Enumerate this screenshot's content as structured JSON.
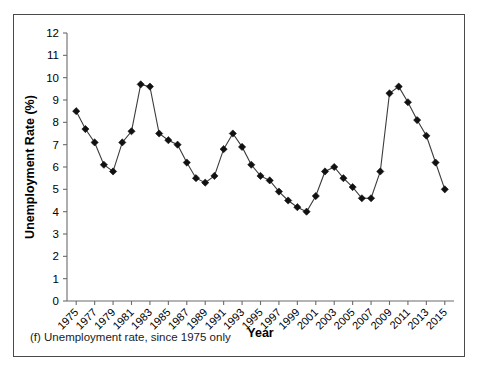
{
  "figure": {
    "caption": "(f) Unemployment rate, since 1975 only"
  },
  "chart_data": {
    "type": "line",
    "title": "",
    "xlabel": "Year",
    "ylabel": "Unemployment Rate (%)",
    "xlim": [
      1974,
      2016
    ],
    "ylim": [
      0,
      12
    ],
    "ytick_step": 1,
    "xtick_step": 2,
    "grid": false,
    "legend": "none",
    "marker": "diamond",
    "line_color": "#3b3b3b",
    "marker_color": "#111111",
    "yticks": [
      0,
      1,
      2,
      3,
      4,
      5,
      6,
      7,
      8,
      9,
      10,
      11,
      12
    ],
    "xticks": [
      1975,
      1977,
      1979,
      1981,
      1983,
      1985,
      1987,
      1989,
      1991,
      1993,
      1995,
      1997,
      1999,
      2001,
      2003,
      2005,
      2007,
      2009,
      2011,
      2013,
      2015
    ],
    "x": [
      1975,
      1976,
      1977,
      1978,
      1979,
      1980,
      1981,
      1982,
      1983,
      1984,
      1985,
      1986,
      1987,
      1988,
      1989,
      1990,
      1991,
      1992,
      1993,
      1994,
      1995,
      1996,
      1997,
      1998,
      1999,
      2000,
      2001,
      2002,
      2003,
      2004,
      2005,
      2006,
      2007,
      2008,
      2009,
      2010,
      2011,
      2012,
      2013,
      2014,
      2015
    ],
    "values": [
      8.5,
      7.7,
      7.1,
      6.1,
      5.8,
      7.1,
      7.6,
      9.7,
      9.6,
      7.5,
      7.2,
      7.0,
      6.2,
      5.5,
      5.3,
      5.6,
      6.8,
      7.5,
      6.9,
      6.1,
      5.6,
      5.4,
      4.9,
      4.5,
      4.2,
      4.0,
      4.7,
      5.8,
      6.0,
      5.5,
      5.1,
      4.6,
      4.6,
      5.8,
      9.3,
      9.6,
      8.9,
      8.1,
      7.4,
      6.2,
      5.0
    ]
  }
}
